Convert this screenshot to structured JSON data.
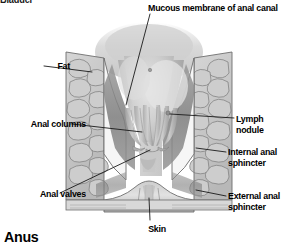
{
  "figure": {
    "caption": "Anus",
    "cutoff_heading": "Bladder",
    "background_color": "#ffffff",
    "label_color": "#000000",
    "leader_line_color": "#1a1a1a",
    "tissue_colors": {
      "fat": "#c9c9c9",
      "fat_outline": "#6e6e6e",
      "mucosa": "#bdbdbd",
      "canal_lumen": "#d2d2d2",
      "sphincter_band": "#8c8c8c",
      "highlight": "#f2f2f2",
      "skin_layer": "#c4c4c4"
    }
  },
  "labels": [
    {
      "id": "mucous",
      "text": "Mucous membrane of anal canal",
      "side": "top"
    },
    {
      "id": "fat",
      "text": "Fat",
      "side": "left"
    },
    {
      "id": "columns",
      "text": "Anal columns",
      "side": "left"
    },
    {
      "id": "valves",
      "text": "Anal valves",
      "side": "left"
    },
    {
      "id": "lymph",
      "text": "Lymph nodule",
      "side": "right"
    },
    {
      "id": "internal",
      "text": "Internal anal\nsphincter",
      "side": "right"
    },
    {
      "id": "external",
      "text": "External anal\nsphincter",
      "side": "right"
    },
    {
      "id": "skin",
      "text": "Skin",
      "side": "bottom"
    }
  ]
}
